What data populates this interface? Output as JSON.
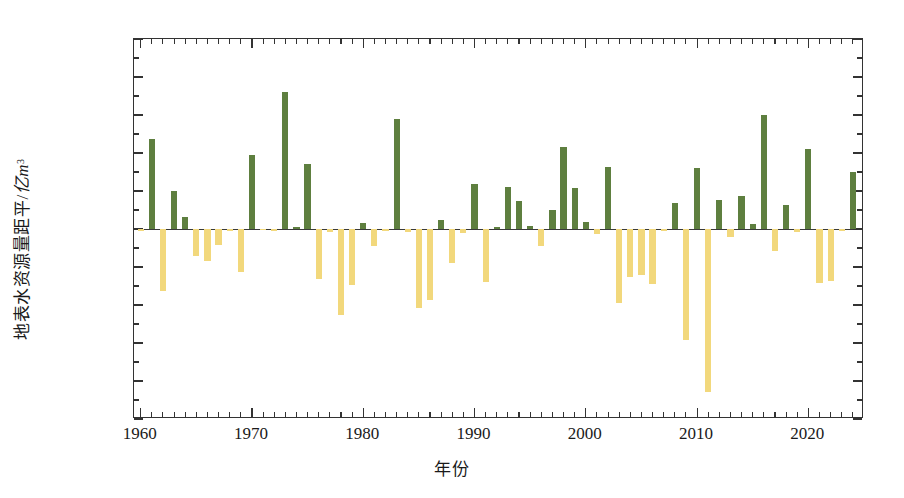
{
  "chart_data": {
    "type": "bar",
    "title": "",
    "xlabel": "年份",
    "ylabel": "地表水资源量距平/亿m³",
    "ylabel_parts": {
      "text": "地表水资源量距平/",
      "unit_italic": "亿m",
      "unit_sup": "3"
    },
    "ylim": [
      -5000,
      5000
    ],
    "ytick_step": 1000,
    "yminor_step": 500,
    "ytick_labels": [
      "5000",
      "4000",
      "3000",
      "2000",
      "1000",
      "0",
      "-1000",
      "-2000",
      "-3000",
      "-4000",
      "-5000"
    ],
    "ytick_values": [
      5000,
      4000,
      3000,
      2000,
      1000,
      0,
      -1000,
      -2000,
      -3000,
      -4000,
      -5000
    ],
    "xlim": [
      1959.4,
      2025.0
    ],
    "xtick_labels": [
      "1960",
      "1970",
      "1980",
      "1990",
      "2000",
      "2010",
      "2020"
    ],
    "xtick_values": [
      1960,
      1970,
      1980,
      1990,
      2000,
      2010,
      2020
    ],
    "xminor_step": 1,
    "grid": false,
    "legend": "none",
    "positive_color": "#5e7f3f",
    "negative_color": "#f2d87c",
    "axis_color": "#333333",
    "categories": [
      1960,
      1961,
      1962,
      1963,
      1964,
      1965,
      1966,
      1967,
      1968,
      1969,
      1970,
      1971,
      1972,
      1973,
      1974,
      1975,
      1976,
      1977,
      1978,
      1979,
      1980,
      1981,
      1982,
      1983,
      1984,
      1985,
      1986,
      1987,
      1988,
      1989,
      1990,
      1991,
      1992,
      1993,
      1994,
      1995,
      1996,
      1997,
      1998,
      1999,
      2000,
      2001,
      2002,
      2003,
      2004,
      2005,
      2006,
      2007,
      2008,
      2009,
      2010,
      2011,
      2012,
      2013,
      2014,
      2015,
      2016,
      2017,
      2018,
      2019,
      2020,
      2021,
      2022,
      2023,
      2024
    ],
    "values": [
      -60,
      2380,
      -1620,
      990,
      320,
      -720,
      -840,
      -420,
      -50,
      -1130,
      1950,
      -30,
      -40,
      3600,
      50,
      1700,
      -1320,
      -90,
      -2270,
      -1470,
      170,
      -440,
      -60,
      2900,
      -70,
      -2070,
      -1860,
      250,
      -890,
      -100,
      1190,
      -1400,
      40,
      1100,
      740,
      90,
      -460,
      490,
      2170,
      1070,
      190,
      -130,
      1620,
      -1940,
      -1260,
      -1220,
      -1460,
      -60,
      680,
      -2930,
      1600,
      -4300,
      770,
      -200,
      870,
      130,
      3000,
      -580,
      640,
      -90,
      2100,
      -1420,
      -1370,
      -40,
      1490
    ]
  }
}
